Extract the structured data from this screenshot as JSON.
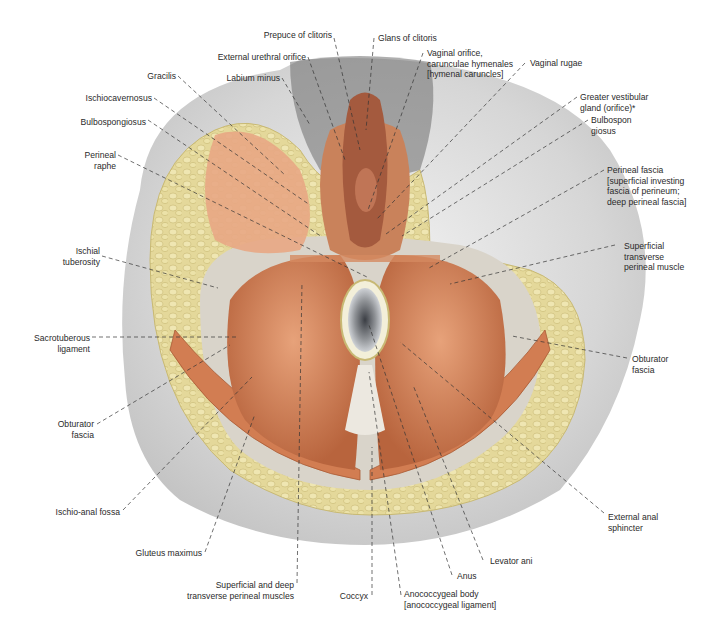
{
  "figure": {
    "colors": {
      "skin_grey": "#d9d9d9",
      "fat_yellow": "#e4d89a",
      "muscle": "#d8895f",
      "muscle_dark": "#b8643d",
      "fascia": "#e8e4dc",
      "anal_grey": "#8f9296",
      "leader_line": "#333333"
    }
  },
  "labels": [
    {
      "id": "prepuce",
      "text": "Prepuce of clitoris"
    },
    {
      "id": "glans",
      "text": "Glans of clitoris"
    },
    {
      "id": "ext_urethral",
      "text": "External urethral orifice"
    },
    {
      "id": "vaginal_orifice",
      "text": "Vaginal orifice,\ncarunculae hymenales\n[hymenal caruncles]"
    },
    {
      "id": "labium_minus",
      "text": "Labium minus"
    },
    {
      "id": "vaginal_rugae",
      "text": "Vaginal rugae"
    },
    {
      "id": "gracilis",
      "text": "Gracilis"
    },
    {
      "id": "greater_vestibular",
      "text": "Greater vestibular\ngland (orifice)*"
    },
    {
      "id": "ischiocavernosus",
      "text": "Ischiocavernosus"
    },
    {
      "id": "bulbospongiosus_l",
      "text": "Bulbospongiosus"
    },
    {
      "id": "bulbospongiosus_r",
      "text": "Bulbospon\ngiosus"
    },
    {
      "id": "perineal_raphe",
      "text": "Perineal\nraphe"
    },
    {
      "id": "perineal_fascia",
      "text": "Perineal fascia\n[superficial investing\nfascia of perineum;\ndeep perineal fascia]"
    },
    {
      "id": "ischial_tuberosity",
      "text": "Ischial\ntuberosity"
    },
    {
      "id": "sup_transverse",
      "text": "Superficial\ntransverse\nperineal muscle"
    },
    {
      "id": "sacrotuberous",
      "text": "Sacrotuberous\nligament"
    },
    {
      "id": "obturator_fascia_r",
      "text": "Obturator\nfascia"
    },
    {
      "id": "obturator_fascia_l",
      "text": "Obturator\nfascia"
    },
    {
      "id": "ischio_anal",
      "text": "Ischio-anal fossa"
    },
    {
      "id": "external_anal",
      "text": "External anal\nsphincter"
    },
    {
      "id": "gluteus",
      "text": "Gluteus maximus"
    },
    {
      "id": "levator",
      "text": "Levator ani"
    },
    {
      "id": "anus",
      "text": "Anus"
    },
    {
      "id": "sup_deep_transverse",
      "text": "Superficial and deep\ntransverse perineal muscles"
    },
    {
      "id": "coccyx",
      "text": "Coccyx"
    },
    {
      "id": "anococcygeal",
      "text": "Anococcygeal body\n[anococcygeal ligament]"
    }
  ]
}
